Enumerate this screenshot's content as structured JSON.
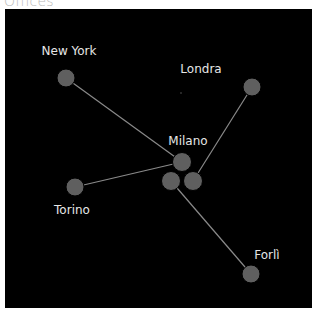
{
  "title": "Offices",
  "colors": {
    "background": "#000000",
    "node": "#5f5f5f",
    "edge": "#8a8a8a",
    "label": "#e6e6e6",
    "title": "#b9b9b9"
  },
  "nodes": [
    {
      "id": "new-york",
      "label": "New York",
      "x": 66,
      "y": 78
    },
    {
      "id": "londra",
      "label": "Londra",
      "x": 252,
      "y": 87
    },
    {
      "id": "milano",
      "label": "Milano",
      "x": 182,
      "y": 162
    },
    {
      "id": "milano-a",
      "label": "",
      "x": 171,
      "y": 181
    },
    {
      "id": "milano-b",
      "label": "",
      "x": 193,
      "y": 181
    },
    {
      "id": "torino",
      "label": "Torino",
      "x": 75,
      "y": 187
    },
    {
      "id": "forli",
      "label": "Forlì",
      "x": 251,
      "y": 274
    }
  ],
  "edges": [
    {
      "from": "new-york",
      "to": "milano"
    },
    {
      "from": "torino",
      "to": "milano"
    },
    {
      "from": "londra",
      "to": "milano-b"
    },
    {
      "from": "milano-a",
      "to": "forli"
    }
  ],
  "labels": {
    "new_york": "New York",
    "londra": "Londra",
    "milano": "Milano",
    "torino": "Torino",
    "forli": "Forlì"
  }
}
